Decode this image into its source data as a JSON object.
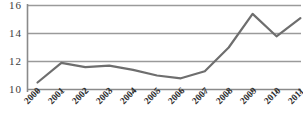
{
  "chart_data": {
    "type": "line",
    "title": "",
    "subtitle": "",
    "xlabel": "",
    "ylabel": "",
    "categories": [
      "2000",
      "2001",
      "2002",
      "2003",
      "2004",
      "2005",
      "2006",
      "2007",
      "2008",
      "2009",
      "2010",
      "2011"
    ],
    "values": [
      1.05,
      1.19,
      1.16,
      1.17,
      1.14,
      1.1,
      1.08,
      1.13,
      1.3,
      1.54,
      1.38,
      1.51
    ],
    "series": [
      {
        "name": "",
        "values": [
          1.05,
          1.19,
          1.16,
          1.17,
          1.14,
          1.1,
          1.08,
          1.13,
          1.3,
          1.54,
          1.38,
          1.51
        ]
      }
    ],
    "ylim": [
      1.0,
      1.6
    ],
    "yticks": [
      1.0,
      1.2,
      1.4,
      1.6
    ],
    "ytick_labels": [
      "10",
      "12",
      "14",
      "16"
    ],
    "xlim": [
      "2000",
      "2011"
    ],
    "grid": true,
    "grid_axis": "y",
    "legend": false,
    "legend_position": "none",
    "annotations": [],
    "colors": {
      "line": "#6e6e6e",
      "grid": "#9a9a9a",
      "axis": "#8a8a8a",
      "text": "#2e2e2e",
      "background": "#ffffff"
    },
    "line_width": 2.2,
    "markers": false
  },
  "axes": {
    "y_ticks": [
      {
        "label": "16",
        "value": 1.6
      },
      {
        "label": "14",
        "value": 1.4
      },
      {
        "label": "12",
        "value": 1.2
      },
      {
        "label": "10",
        "value": 1.0
      }
    ],
    "x_ticks": [
      {
        "label": "2000"
      },
      {
        "label": "2001"
      },
      {
        "label": "2002"
      },
      {
        "label": "2003"
      },
      {
        "label": "2004"
      },
      {
        "label": "2005"
      },
      {
        "label": "2006"
      },
      {
        "label": "2007"
      },
      {
        "label": "2008"
      },
      {
        "label": "2009"
      },
      {
        "label": "2010"
      },
      {
        "label": "2011"
      }
    ]
  }
}
